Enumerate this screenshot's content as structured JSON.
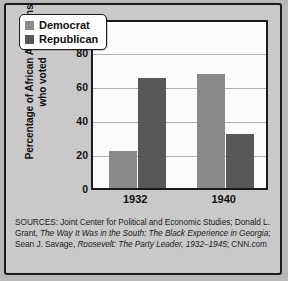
{
  "figure": {
    "y_axis_title_line1": "Percentage of African Americans",
    "y_axis_title_line2": "who voted"
  },
  "legend": {
    "items": [
      {
        "label": "Democrat",
        "color": "#8a8a8a",
        "icon": "legend-swatch-icon"
      },
      {
        "label": "Republican",
        "color": "#585858",
        "icon": "legend-swatch-icon"
      }
    ]
  },
  "sources": {
    "prefix": "SOURCES: Joint Center for Political and Economic Studies; Donald L. Grant, ",
    "title1": "The Way It Was in the South: The Black Experience in Georgia",
    "mid": "; Sean J. Savage, ",
    "title2": "Roosevelt: The Party Leader, 1932–1945",
    "suffix": "; CNN.com"
  },
  "chart_data": {
    "type": "bar",
    "title": "",
    "xlabel": "",
    "ylabel": "Percentage of African Americans who voted",
    "categories": [
      "1932",
      "1940"
    ],
    "series": [
      {
        "name": "Democrat",
        "values": [
          22,
          67
        ],
        "color": "#8a8a8a"
      },
      {
        "name": "Republican",
        "values": [
          65,
          32
        ],
        "color": "#585858"
      }
    ],
    "ylim": [
      0,
      100
    ],
    "yticks": [
      0,
      20,
      40,
      60,
      80,
      100
    ],
    "ytick_labels": [
      "0",
      "20",
      "40",
      "60",
      "80",
      "100"
    ],
    "grid": true,
    "legend_position": "top-left"
  }
}
